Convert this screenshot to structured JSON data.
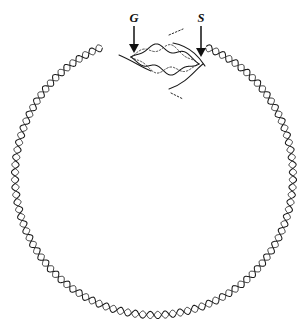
{
  "figure": {
    "background_color": "#ffffff",
    "line_color": "#1a1a1a",
    "canvas": {
      "width": 308,
      "height": 333
    }
  },
  "circle": {
    "center_x": 154,
    "center_y": 176,
    "radius_x": 139,
    "radius_y": 139,
    "style": "double-helix",
    "turns": 58,
    "amplitude": 3.6,
    "gap_start_deg": 248,
    "gap_end_deg": 292
  },
  "bubble": {
    "label": "replication bubble",
    "left_fork_x": 131,
    "left_fork_y": 57,
    "right_fork_x": 199,
    "right_fork_y": 64,
    "upper_arm_peak_y": 41,
    "lower_arm_peak_y": 73,
    "new_strand_style": "dotted",
    "template_strand_style": "solid"
  },
  "markers": [
    {
      "id": "fork-g",
      "label": "G",
      "label_x": 134,
      "label_y": 22,
      "arrow_x": 134,
      "arrow_top_y": 26,
      "arrow_tip_y": 53,
      "direction": "down"
    },
    {
      "id": "fork-s",
      "label": "S",
      "label_x": 201,
      "label_y": 22,
      "arrow_x": 201,
      "arrow_top_y": 26,
      "arrow_tip_y": 57,
      "direction": "down"
    }
  ]
}
